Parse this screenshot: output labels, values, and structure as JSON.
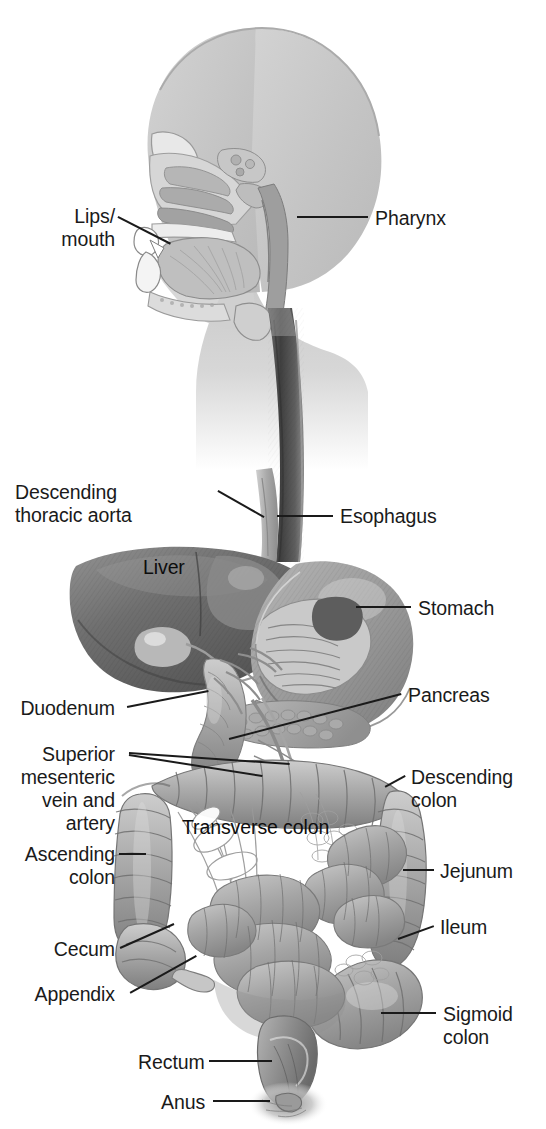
{
  "figure": {
    "background_color": "#ffffff",
    "ink_color": "#1a1a1a",
    "width": 546,
    "height": 1129
  },
  "labels": [
    {
      "id": "lips-mouth",
      "text": "Lips/\nmouth",
      "align": "right",
      "x": 18,
      "y": 205,
      "lines": 2
    },
    {
      "id": "pharynx",
      "text": "Pharynx",
      "align": "left",
      "x": 375,
      "y": 207,
      "lines": 1
    },
    {
      "id": "descending-thoracic-aorta",
      "text": "Descending\nthoracic aorta",
      "align": "right",
      "x": 15,
      "y": 481,
      "lines": 2
    },
    {
      "id": "esophagus",
      "text": "Esophagus",
      "align": "left",
      "x": 340,
      "y": 505,
      "lines": 1
    },
    {
      "id": "liver",
      "text": "Liver",
      "align": "left",
      "x": 143,
      "y": 556,
      "lines": 1,
      "on_organ": true
    },
    {
      "id": "stomach",
      "text": "Stomach",
      "align": "left",
      "x": 418,
      "y": 597,
      "lines": 1
    },
    {
      "id": "duodenum",
      "text": "Duodenum",
      "align": "right",
      "x": 17,
      "y": 697,
      "lines": 1
    },
    {
      "id": "pancreas",
      "text": "Pancreas",
      "align": "left",
      "x": 408,
      "y": 684,
      "lines": 1
    },
    {
      "id": "superior-mesenteric",
      "text": "Superior\nmesenteric\nvein and\nartery",
      "align": "right",
      "x": 13,
      "y": 743,
      "lines": 4
    },
    {
      "id": "descending-colon",
      "text": "Descending\ncolon",
      "align": "left",
      "x": 411,
      "y": 766,
      "lines": 2
    },
    {
      "id": "transverse-colon",
      "text": "Transverse colon",
      "align": "left",
      "x": 182,
      "y": 816,
      "lines": 1,
      "on_organ": true
    },
    {
      "id": "ascending-colon",
      "text": "Ascending\ncolon",
      "align": "right",
      "x": 13,
      "y": 843,
      "lines": 2
    },
    {
      "id": "jejunum",
      "text": "Jejunum",
      "align": "left",
      "x": 440,
      "y": 860,
      "lines": 1
    },
    {
      "id": "ileum",
      "text": "Ileum",
      "align": "left",
      "x": 440,
      "y": 916,
      "lines": 1
    },
    {
      "id": "cecum",
      "text": "Cecum",
      "align": "right",
      "x": 20,
      "y": 938,
      "lines": 1
    },
    {
      "id": "appendix",
      "text": "Appendix",
      "align": "right",
      "x": 20,
      "y": 983,
      "lines": 1
    },
    {
      "id": "sigmoid-colon",
      "text": "Sigmoid\ncolon",
      "align": "left",
      "x": 443,
      "y": 1003,
      "lines": 2
    },
    {
      "id": "rectum",
      "text": "Rectum",
      "align": "right",
      "x": 138,
      "y": 1051,
      "lines": 1
    },
    {
      "id": "anus",
      "text": "Anus",
      "align": "right",
      "x": 161,
      "y": 1091,
      "lines": 1
    }
  ],
  "leaders": [
    {
      "id": "leader-lips-mouth",
      "x1": 118,
      "y1": 216,
      "x2": 171,
      "y2": 243
    },
    {
      "id": "leader-pharynx",
      "x1": 297,
      "y1": 216,
      "x2": 368,
      "y2": 216
    },
    {
      "id": "leader-descending-thoracic-aorta",
      "x1": 218,
      "y1": 490,
      "x2": 264,
      "y2": 516
    },
    {
      "id": "leader-esophagus",
      "x1": 277,
      "y1": 515,
      "x2": 333,
      "y2": 515
    },
    {
      "id": "leader-stomach",
      "x1": 356,
      "y1": 606,
      "x2": 411,
      "y2": 606
    },
    {
      "id": "leader-duodenum",
      "x1": 127,
      "y1": 706,
      "x2": 208,
      "y2": 690
    },
    {
      "id": "leader-pancreas",
      "x1": 229,
      "y1": 738,
      "x2": 401,
      "y2": 693
    },
    {
      "id": "leader-smv-1",
      "x1": 129,
      "y1": 752,
      "x2": 290,
      "y2": 763
    },
    {
      "id": "leader-smv-2",
      "x1": 129,
      "y1": 754,
      "x2": 262,
      "y2": 775
    },
    {
      "id": "leader-descending-colon",
      "x1": 385,
      "y1": 786,
      "x2": 405,
      "y2": 775
    },
    {
      "id": "leader-ascending-colon",
      "x1": 119,
      "y1": 853,
      "x2": 146,
      "y2": 853
    },
    {
      "id": "leader-jejunum",
      "x1": 403,
      "y1": 869,
      "x2": 434,
      "y2": 869
    },
    {
      "id": "leader-ileum",
      "x1": 398,
      "y1": 938,
      "x2": 434,
      "y2": 925
    },
    {
      "id": "leader-cecum",
      "x1": 120,
      "y1": 947,
      "x2": 174,
      "y2": 923
    },
    {
      "id": "leader-appendix",
      "x1": 130,
      "y1": 992,
      "x2": 196,
      "y2": 955
    },
    {
      "id": "leader-sigmoid-colon",
      "x1": 381,
      "y1": 1012,
      "x2": 436,
      "y2": 1012
    },
    {
      "id": "leader-rectum",
      "x1": 209,
      "y1": 1060,
      "x2": 272,
      "y2": 1060
    },
    {
      "id": "leader-anus",
      "x1": 213,
      "y1": 1100,
      "x2": 270,
      "y2": 1100
    }
  ],
  "anatomy_parts": [
    "head-silhouette",
    "nasal-cavity",
    "tongue",
    "oral-cavity",
    "pharynx-airway",
    "neck-silhouette",
    "esophagus-tube",
    "descending-thoracic-aorta",
    "liver",
    "gallbladder",
    "stomach",
    "pancreas",
    "duodenum",
    "transverse-colon",
    "ascending-colon",
    "descending-colon",
    "sigmoid-colon",
    "cecum",
    "appendix",
    "jejunum",
    "ileum",
    "mesentery",
    "rectum",
    "anus"
  ]
}
